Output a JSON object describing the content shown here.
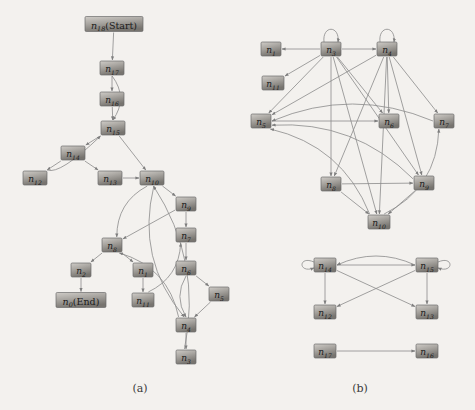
{
  "figure": {
    "background_color": "#f3f1ee",
    "node_fill_light": "#b9b6b1",
    "node_fill_dark": "#6f6c68",
    "node_stroke": "#6b6b6b",
    "edge_color": "#8a8a8a",
    "label_color": "#1b1b1b"
  },
  "captions": [
    {
      "id": "caption-a",
      "text": "(a)",
      "x": 140,
      "y": 392
    },
    {
      "id": "caption-b",
      "text": "(b)",
      "x": 360,
      "y": 392
    }
  ],
  "graphs": [
    {
      "id": "graph-a",
      "caption": "(a)",
      "type": "directed-graph",
      "nodes": [
        {
          "id": "a-n18",
          "base": "n",
          "sub": "18",
          "suffix": "(Start)",
          "x": 114,
          "y": 24,
          "w": 58,
          "h": 15
        },
        {
          "id": "a-n17",
          "base": "n",
          "sub": "17",
          "suffix": "",
          "x": 112,
          "y": 68,
          "w": 24,
          "h": 14
        },
        {
          "id": "a-n16",
          "base": "n",
          "sub": "16",
          "suffix": "",
          "x": 112,
          "y": 99,
          "w": 24,
          "h": 14
        },
        {
          "id": "a-n15",
          "base": "n",
          "sub": "15",
          "suffix": "",
          "x": 113,
          "y": 128,
          "w": 24,
          "h": 14
        },
        {
          "id": "a-n14",
          "base": "n",
          "sub": "14",
          "suffix": "",
          "x": 73,
          "y": 153,
          "w": 24,
          "h": 14
        },
        {
          "id": "a-n12",
          "base": "n",
          "sub": "12",
          "suffix": "",
          "x": 35,
          "y": 178,
          "w": 24,
          "h": 14
        },
        {
          "id": "a-n13",
          "base": "n",
          "sub": "13",
          "suffix": "",
          "x": 110,
          "y": 178,
          "w": 24,
          "h": 14
        },
        {
          "id": "a-n10",
          "base": "n",
          "sub": "10",
          "suffix": "",
          "x": 152,
          "y": 178,
          "w": 24,
          "h": 14
        },
        {
          "id": "a-n9",
          "base": "n",
          "sub": "9",
          "suffix": "",
          "x": 186,
          "y": 204,
          "w": 20,
          "h": 14
        },
        {
          "id": "a-n7",
          "base": "n",
          "sub": "7",
          "suffix": "",
          "x": 186,
          "y": 235,
          "w": 20,
          "h": 14
        },
        {
          "id": "a-n8",
          "base": "n",
          "sub": "8",
          "suffix": "",
          "x": 112,
          "y": 245,
          "w": 20,
          "h": 14
        },
        {
          "id": "a-n2",
          "base": "n",
          "sub": "2",
          "suffix": "",
          "x": 81,
          "y": 270,
          "w": 20,
          "h": 14
        },
        {
          "id": "a-n1",
          "base": "n",
          "sub": "1",
          "suffix": "",
          "x": 143,
          "y": 270,
          "w": 20,
          "h": 14
        },
        {
          "id": "a-n6",
          "base": "n",
          "sub": "6",
          "suffix": "",
          "x": 186,
          "y": 268,
          "w": 20,
          "h": 14
        },
        {
          "id": "a-n0",
          "base": "n",
          "sub": "0",
          "suffix": "(End)",
          "x": 81,
          "y": 300,
          "w": 50,
          "h": 15
        },
        {
          "id": "a-n11",
          "base": "n",
          "sub": "11",
          "suffix": "",
          "x": 143,
          "y": 300,
          "w": 22,
          "h": 14
        },
        {
          "id": "a-n5",
          "base": "n",
          "sub": "5",
          "suffix": "",
          "x": 219,
          "y": 294,
          "w": 20,
          "h": 14
        },
        {
          "id": "a-n4",
          "base": "n",
          "sub": "4",
          "suffix": "",
          "x": 186,
          "y": 325,
          "w": 20,
          "h": 14
        },
        {
          "id": "a-n3",
          "base": "n",
          "sub": "3",
          "suffix": "",
          "x": 186,
          "y": 357,
          "w": 20,
          "h": 14
        }
      ],
      "edges": [
        {
          "from": "a-n18",
          "to": "a-n17",
          "style": "straight"
        },
        {
          "from": "a-n17",
          "to": "a-n16",
          "style": "straight"
        },
        {
          "from": "a-n17",
          "to": "a-n15",
          "style": "curve-right"
        },
        {
          "from": "a-n16",
          "to": "a-n15",
          "style": "straight"
        },
        {
          "from": "a-n15",
          "to": "a-n14",
          "style": "straight"
        },
        {
          "from": "a-n15",
          "to": "a-n10",
          "style": "straight"
        },
        {
          "from": "a-n14",
          "to": "a-n12",
          "style": "straight"
        },
        {
          "from": "a-n14",
          "to": "a-n13",
          "style": "straight"
        },
        {
          "from": "a-n12",
          "to": "a-n15",
          "style": "curve-left"
        },
        {
          "from": "a-n13",
          "to": "a-n10",
          "style": "straight"
        },
        {
          "from": "a-n10",
          "to": "a-n9",
          "style": "straight"
        },
        {
          "from": "a-n10",
          "to": "a-n8",
          "style": "curve"
        },
        {
          "from": "a-n10",
          "to": "a-n4",
          "style": "curve"
        },
        {
          "from": "a-n9",
          "to": "a-n7",
          "style": "straight"
        },
        {
          "from": "a-n9",
          "to": "a-n8",
          "style": "straight"
        },
        {
          "from": "a-n7",
          "to": "a-n6",
          "style": "straight"
        },
        {
          "from": "a-n8",
          "to": "a-n2",
          "style": "straight"
        },
        {
          "from": "a-n8",
          "to": "a-n1",
          "style": "straight"
        },
        {
          "from": "a-n2",
          "to": "a-n0",
          "style": "straight"
        },
        {
          "from": "a-n1",
          "to": "a-n11",
          "style": "straight"
        },
        {
          "from": "a-n6",
          "to": "a-n5",
          "style": "straight"
        },
        {
          "from": "a-n6",
          "to": "a-n4",
          "style": "curve"
        },
        {
          "from": "a-n5",
          "to": "a-n4",
          "style": "straight"
        },
        {
          "from": "a-n4",
          "to": "a-n3",
          "style": "straight"
        },
        {
          "from": "a-n4",
          "to": "a-n8",
          "style": "curve"
        },
        {
          "from": "a-n11",
          "to": "a-n7",
          "style": "curve"
        },
        {
          "from": "a-n3",
          "to": "a-n10",
          "style": "curve"
        }
      ]
    },
    {
      "id": "graph-b",
      "caption": "(b)",
      "type": "directed-graph",
      "nodes": [
        {
          "id": "b-n1",
          "base": "n",
          "sub": "1",
          "suffix": "",
          "x": 271,
          "y": 49,
          "w": 20,
          "h": 14
        },
        {
          "id": "b-n3",
          "base": "n",
          "sub": "3",
          "suffix": "",
          "x": 331,
          "y": 49,
          "w": 20,
          "h": 14
        },
        {
          "id": "b-n4",
          "base": "n",
          "sub": "4",
          "suffix": "",
          "x": 387,
          "y": 49,
          "w": 20,
          "h": 14
        },
        {
          "id": "b-n11",
          "base": "n",
          "sub": "11",
          "suffix": "",
          "x": 273,
          "y": 83,
          "w": 22,
          "h": 14
        },
        {
          "id": "b-n5",
          "base": "n",
          "sub": "5",
          "suffix": "",
          "x": 261,
          "y": 121,
          "w": 20,
          "h": 14
        },
        {
          "id": "b-n6",
          "base": "n",
          "sub": "6",
          "suffix": "",
          "x": 389,
          "y": 121,
          "w": 20,
          "h": 14
        },
        {
          "id": "b-n7",
          "base": "n",
          "sub": "7",
          "suffix": "",
          "x": 444,
          "y": 121,
          "w": 20,
          "h": 14
        },
        {
          "id": "b-n8",
          "base": "n",
          "sub": "8",
          "suffix": "",
          "x": 331,
          "y": 184,
          "w": 20,
          "h": 14
        },
        {
          "id": "b-n9",
          "base": "n",
          "sub": "9",
          "suffix": "",
          "x": 424,
          "y": 183,
          "w": 20,
          "h": 14
        },
        {
          "id": "b-n10",
          "base": "n",
          "sub": "10",
          "suffix": "",
          "x": 379,
          "y": 222,
          "w": 22,
          "h": 14
        },
        {
          "id": "b-n14",
          "base": "n",
          "sub": "14",
          "suffix": "",
          "x": 325,
          "y": 265,
          "w": 22,
          "h": 14
        },
        {
          "id": "b-n15",
          "base": "n",
          "sub": "15",
          "suffix": "",
          "x": 427,
          "y": 265,
          "w": 22,
          "h": 14
        },
        {
          "id": "b-n12",
          "base": "n",
          "sub": "12",
          "suffix": "",
          "x": 325,
          "y": 312,
          "w": 22,
          "h": 14
        },
        {
          "id": "b-n13",
          "base": "n",
          "sub": "13",
          "suffix": "",
          "x": 427,
          "y": 312,
          "w": 22,
          "h": 14
        },
        {
          "id": "b-n17",
          "base": "n",
          "sub": "17",
          "suffix": "",
          "x": 325,
          "y": 351,
          "w": 22,
          "h": 14
        },
        {
          "id": "b-n16",
          "base": "n",
          "sub": "16",
          "suffix": "",
          "x": 427,
          "y": 351,
          "w": 22,
          "h": 14
        }
      ],
      "edges": [
        {
          "from": "b-n3",
          "to": "b-n1",
          "style": "straight"
        },
        {
          "from": "b-n3",
          "to": "b-n3",
          "style": "self-loop"
        },
        {
          "from": "b-n3",
          "to": "b-n4",
          "style": "straight"
        },
        {
          "from": "b-n4",
          "to": "b-n4",
          "style": "self-loop"
        },
        {
          "from": "b-n3",
          "to": "b-n11",
          "style": "straight"
        },
        {
          "from": "b-n3",
          "to": "b-n5",
          "style": "straight"
        },
        {
          "from": "b-n3",
          "to": "b-n6",
          "style": "straight"
        },
        {
          "from": "b-n3",
          "to": "b-n8",
          "style": "straight"
        },
        {
          "from": "b-n3",
          "to": "b-n9",
          "style": "straight"
        },
        {
          "from": "b-n3",
          "to": "b-n10",
          "style": "straight"
        },
        {
          "from": "b-n4",
          "to": "b-n5",
          "style": "straight"
        },
        {
          "from": "b-n4",
          "to": "b-n6",
          "style": "straight"
        },
        {
          "from": "b-n4",
          "to": "b-n7",
          "style": "straight"
        },
        {
          "from": "b-n4",
          "to": "b-n8",
          "style": "straight"
        },
        {
          "from": "b-n4",
          "to": "b-n9",
          "style": "straight"
        },
        {
          "from": "b-n4",
          "to": "b-n10",
          "style": "straight"
        },
        {
          "from": "b-n5",
          "to": "b-n6",
          "style": "straight"
        },
        {
          "from": "b-n8",
          "to": "b-n9",
          "style": "straight"
        },
        {
          "from": "b-n8",
          "to": "b-n10",
          "style": "straight"
        },
        {
          "from": "b-n9",
          "to": "b-n10",
          "style": "straight"
        },
        {
          "from": "b-n10",
          "to": "b-n5",
          "style": "curve"
        },
        {
          "from": "b-n10",
          "to": "b-n7",
          "style": "curve"
        },
        {
          "from": "b-n9",
          "to": "b-n5",
          "style": "curve"
        },
        {
          "from": "b-n7",
          "to": "b-n5",
          "style": "curve"
        },
        {
          "from": "b-n14",
          "to": "b-n14",
          "style": "self-loop"
        },
        {
          "from": "b-n15",
          "to": "b-n15",
          "style": "self-loop"
        },
        {
          "from": "b-n14",
          "to": "b-n15",
          "style": "straight"
        },
        {
          "from": "b-n15",
          "to": "b-n14",
          "style": "curve-top"
        },
        {
          "from": "b-n14",
          "to": "b-n12",
          "style": "straight"
        },
        {
          "from": "b-n14",
          "to": "b-n13",
          "style": "straight"
        },
        {
          "from": "b-n15",
          "to": "b-n12",
          "style": "straight"
        },
        {
          "from": "b-n15",
          "to": "b-n13",
          "style": "straight"
        },
        {
          "from": "b-n17",
          "to": "b-n16",
          "style": "straight"
        }
      ]
    }
  ]
}
